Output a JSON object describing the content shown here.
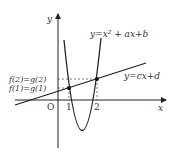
{
  "diagram": {
    "axes": {
      "x_label": "x",
      "y_label": "y",
      "origin_label": "O",
      "x_ticks": [
        "1",
        "2"
      ]
    },
    "curves": {
      "parabola_label": "y=x² + ax+b",
      "line_label": "y=cx+d"
    },
    "annotations": {
      "upper_equality": "f(2)=g(2)",
      "lower_equality": "f(1)=g(1)"
    },
    "colors": {
      "stroke": "#222222",
      "dashed": "#555555"
    }
  }
}
